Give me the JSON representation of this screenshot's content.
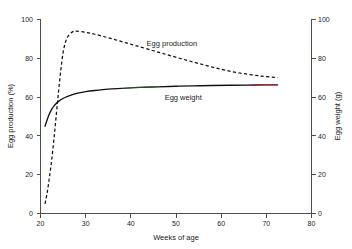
{
  "chart_data": {
    "type": "line",
    "title": "",
    "xlabel": "Weeks of age",
    "ylabel": "Egg production (%)",
    "y2label": "Egg weight (g)",
    "xlim": [
      20,
      80
    ],
    "ylim": [
      0,
      100
    ],
    "y2lim": [
      0,
      100
    ],
    "grid": false,
    "legend_position": "inline-annotation",
    "xticks": [
      20,
      30,
      40,
      50,
      60,
      70,
      80
    ],
    "yticks": [
      0,
      20,
      40,
      60,
      80,
      100
    ],
    "y2ticks": [
      0,
      20,
      40,
      60,
      80,
      100
    ],
    "series": [
      {
        "name": "Egg production",
        "axis": "left",
        "style": "dashed",
        "color": "#111111",
        "x": [
          21,
          21.5,
          22,
          22.5,
          23,
          23.5,
          24,
          24.5,
          25,
          25.5,
          26,
          27,
          28,
          30,
          32,
          35,
          38,
          41,
          45,
          49,
          53,
          57,
          61,
          65,
          69,
          72.5
        ],
        "values": [
          5,
          11,
          19,
          28,
          39,
          51,
          63,
          74,
          83,
          88,
          91,
          93.5,
          94,
          93.4,
          92.4,
          90.6,
          88.6,
          86.6,
          83.9,
          81.2,
          78.6,
          76.1,
          73.8,
          72.1,
          70.8,
          70
        ]
      },
      {
        "name": "Egg weight",
        "axis": "right",
        "style": "solid",
        "color": "#111111",
        "x": [
          21,
          21.5,
          22,
          22.5,
          23,
          24,
          25,
          26,
          28,
          30,
          32,
          35,
          38,
          42,
          46,
          50,
          54,
          58,
          62,
          66,
          70,
          72.5
        ],
        "values": [
          45,
          48.5,
          51.5,
          53.8,
          55.5,
          57.8,
          59.3,
          60.4,
          61.9,
          62.8,
          63.4,
          64.1,
          64.5,
          65,
          65.3,
          65.6,
          65.8,
          66,
          66.1,
          66.2,
          66.3,
          66.3
        ]
      }
    ],
    "annotations": [
      {
        "text": "Egg production",
        "x": 43.5,
        "y": 86.5
      },
      {
        "text": "Egg weight",
        "x": 47.5,
        "y": 58.5
      }
    ]
  }
}
